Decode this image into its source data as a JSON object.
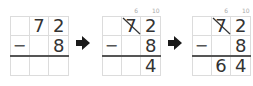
{
  "steps": [
    {
      "name": "step-1",
      "rows": [
        [
          "",
          "7",
          "2"
        ],
        [
          "−",
          "",
          "8"
        ],
        [
          "",
          "",
          ""
        ]
      ],
      "borrow": null
    },
    {
      "name": "step-2",
      "rows": [
        [
          "",
          "7",
          "2"
        ],
        [
          "−",
          "",
          "8"
        ],
        [
          "",
          "",
          "4"
        ]
      ],
      "borrow": {
        "tens": "6",
        "ones": "10",
        "crossed": "7"
      }
    },
    {
      "name": "step-3",
      "rows": [
        [
          "",
          "7",
          "2"
        ],
        [
          "−",
          "",
          "8"
        ],
        [
          "",
          "6",
          "4"
        ]
      ],
      "borrow": {
        "tens": "6",
        "ones": "10",
        "crossed": "7"
      }
    }
  ],
  "arrow_icon": "right-arrow-icon",
  "colors": {
    "grid": "#dcdcdc",
    "text": "#333333",
    "rule": "#555555",
    "arrow": "#1a1a1a"
  }
}
